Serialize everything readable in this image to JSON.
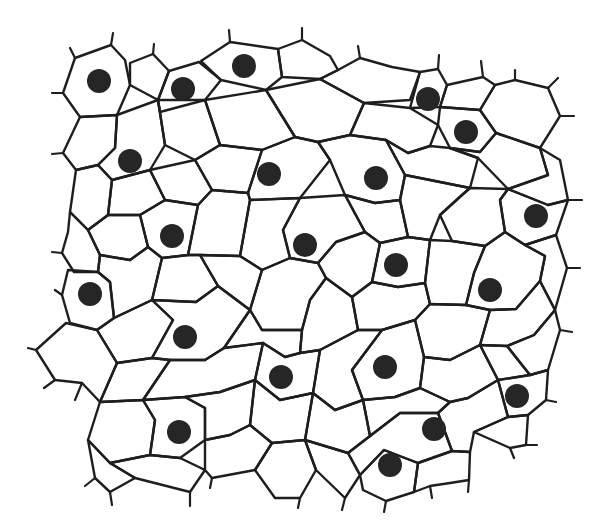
{
  "diagram": {
    "colors": {
      "background": "#ffffff",
      "cell_wall": "#1e1e1e",
      "nucleus": "#262626"
    },
    "nucleus_radius": 12,
    "nuclei": [
      [
        99,
        81
      ],
      [
        183,
        89
      ],
      [
        244,
        66
      ],
      [
        428,
        99
      ],
      [
        466,
        132
      ],
      [
        130,
        161
      ],
      [
        269,
        174
      ],
      [
        376,
        178
      ],
      [
        536,
        216
      ],
      [
        172,
        236
      ],
      [
        305,
        245
      ],
      [
        396,
        265
      ],
      [
        90,
        294
      ],
      [
        490,
        290
      ],
      [
        185,
        337
      ],
      [
        385,
        367
      ],
      [
        281,
        377
      ],
      [
        517,
        396
      ],
      [
        434,
        429
      ],
      [
        179,
        432
      ],
      [
        390,
        465
      ]
    ],
    "cells": [
      "M75,58 L111,45 L125,60 L130,85 L117,115 L80,117 L63,93 Z",
      "M130,63 L153,54 L169,71 L158,100 L130,85 Z",
      "M169,71 L199,62 L221,80 L205,100 L160,112 L158,100 Z",
      "M201,61 L230,42 L278,49 L282,77 L266,90 L221,80 Z",
      "M278,49 L302,40 L330,56 L338,70 L320,79 L282,77 Z",
      "M338,70 L360,58 L392,67 L420,72 L410,100 L364,103 L320,79 Z",
      "M420,72 L438,69 L447,85 L440,107 L410,108 Z",
      "M447,85 L483,77 L495,85 L480,110 L440,107 Z",
      "M495,85 L515,80 L548,88 L560,116 L540,148 L496,133 L480,110 Z",
      "M440,107 L480,110 L496,133 L480,152 L450,148 L438,125 Z",
      "M364,103 L410,108 L438,125 L430,146 L408,153 L386,140 L350,135 Z",
      "M266,90 L320,79 L364,103 L350,135 L318,142 L295,137 Z",
      "M205,100 L266,90 L295,137 L262,150 L220,145 Z",
      "M158,100 L205,100 L220,145 L195,160 L165,145 Z",
      "M80,117 L117,115 L115,148 L98,165 L76,170 L63,153 Z",
      "M117,115 L158,100 L165,145 L150,170 L112,180 L98,165 L115,148 Z",
      "M76,170 L98,165 L112,180 L108,215 L88,230 L70,212 Z",
      "M112,180 L150,170 L165,200 L140,215 L108,215 Z",
      "M150,170 L195,160 L212,190 L198,205 L165,200 Z",
      "M220,145 L262,150 L248,193 L212,190 L195,160 Z",
      "M262,150 L295,137 L318,142 L330,160 L300,198 L250,200 L248,193 Z",
      "M318,142 L350,135 L386,140 L405,175 L400,200 L375,203 L345,195 L330,160 Z",
      "M408,153 L430,146 L450,148 L478,158 L470,188 L405,175 L386,140 Z",
      "M450,148 L480,152 L496,133 L540,148 L548,175 L508,189 L478,158 Z",
      "M540,148 L560,160 L568,200 L548,205 L508,189 L548,175 Z",
      "M508,189 L548,205 L568,200 L556,235 L525,245 L505,232 L500,200 Z",
      "M470,188 L508,189 L500,200 L505,232 L485,246 L452,241 L440,215 L462,195 Z",
      "M405,175 L470,188 L462,195 L440,215 L430,240 L408,237 L400,200 Z",
      "M345,195 L375,203 L400,200 L408,237 L380,243 L365,232 Z",
      "M300,198 L345,195 L365,232 L336,242 L318,263 L290,258 L283,230 Z",
      "M250,200 L300,198 L283,230 L290,258 L262,270 L240,256 Z",
      "M198,205 L212,190 L248,193 L250,200 L240,256 L200,255 L188,255 Z",
      "M140,215 L165,200 L198,205 L188,255 L162,258 L148,247 Z",
      "M108,215 L140,215 L148,247 L130,260 L100,255 L88,230 Z",
      "M70,212 L88,230 L100,255 L98,272 L74,272 L62,253 L68,232 Z",
      "M68,270 L98,272 L110,282 L114,318 L97,330 L70,323 L62,295 Z",
      "M100,255 L130,260 L148,247 L162,258 L152,300 L114,318 L110,282 L98,272 Z",
      "M162,258 L188,255 L200,255 L218,286 L196,302 L152,300 Z",
      "M200,255 L240,256 L262,270 L250,310 L218,286 Z",
      "M262,270 L290,258 L318,263 L326,278 L310,300 L302,330 L262,330 L250,310 Z",
      "M318,263 L336,242 L365,232 L380,243 L372,282 L352,297 L326,278 Z",
      "M380,243 L408,237 L430,240 L425,283 L398,287 L372,282 Z",
      "M430,240 L452,241 L485,246 L474,273 L466,305 L430,304 L425,283 Z",
      "M485,246 L505,232 L525,245 L545,256 L540,281 L516,309 L490,310 L466,305 L474,273 Z",
      "M525,245 L556,235 L567,268 L555,310 L540,281 L545,256 Z",
      "M114,318 L152,300 L173,320 L152,358 L117,363 L97,330 Z",
      "M152,300 L196,302 L218,286 L250,310 L224,348 L205,360 L170,360 L152,358 L173,320 Z",
      "M250,310 L262,330 L302,330 L300,353 L285,357 L263,343 L224,348 Z",
      "M302,330 L310,300 L326,278 L352,297 L358,330 L320,350 L300,353 Z",
      "M352,297 L372,282 L398,287 L425,283 L430,304 L415,320 L382,330 L358,330 Z",
      "M430,304 L466,305 L490,310 L480,345 L450,360 L424,357 L415,320 Z",
      "M490,310 L516,309 L540,281 L555,310 L534,335 L507,346 L480,345 Z",
      "M555,310 L560,330 L548,370 L530,375 L507,346 L534,335 Z",
      "M36,350 L66,323 L97,330 L117,363 L100,402 L82,383 L55,380 Z",
      "M117,363 L152,358 L170,360 L143,400 L100,402 Z",
      "M170,360 L205,360 L224,348 L263,343 L255,380 L220,392 L185,397 L143,400 Z",
      "M263,343 L285,357 L300,353 L320,350 L313,393 L280,400 L255,380 Z",
      "M320,350 L358,330 L382,330 L352,370 L363,400 L335,410 L313,393 Z",
      "M382,330 L415,320 L424,357 L420,388 L395,397 L363,400 L352,370 Z",
      "M424,357 L450,360 L480,345 L498,380 L468,398 L450,402 L420,388 Z",
      "M480,345 L507,346 L530,375 L498,380 Z",
      "M530,375 L548,370 L546,400 L528,415 L508,417 L498,380 Z",
      "M100,402 L143,400 L155,420 L150,455 L110,463 L88,440 Z",
      "M143,400 L185,397 L205,408 L205,440 L180,458 L150,455 L155,420 Z",
      "M185,397 L220,392 L255,380 L250,425 L230,435 L205,440 L205,408 Z",
      "M255,380 L280,400 L313,393 L305,440 L272,443 L250,425 Z",
      "M313,393 L335,410 L363,400 L370,436 L348,453 L305,440 Z",
      "M363,400 L395,397 L420,388 L450,402 L438,413 L400,413 L370,436 Z",
      "M450,402 L468,398 L498,380 L508,417 L474,432 L470,452 L452,451 L438,413 Z",
      "M508,417 L528,415 L526,445 L510,448 L474,432 Z",
      "M88,440 L110,463 L135,478 L110,492 L95,478 Z",
      "M110,463 L150,455 L180,458 L205,470 L190,492 L135,478 Z",
      "M205,440 L230,435 L250,425 L272,443 L255,470 L212,478 L205,470 Z",
      "M272,443 L305,440 L316,470 L300,498 L275,498 L255,470 Z",
      "M305,440 L348,453 L360,475 L345,498 L316,470 Z",
      "M348,453 L370,436 L400,413 L438,413 L452,451 L418,463 L384,450 L360,475 Z",
      "M360,475 L384,450 L418,463 L414,492 L386,501 L363,490 Z",
      "M418,463 L452,451 L470,452 L469,480 L450,483 L430,486 L414,492 Z"
    ]
  }
}
